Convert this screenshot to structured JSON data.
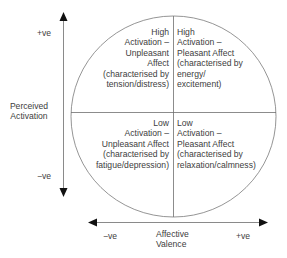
{
  "diagram": {
    "type": "circumplex-model-of-affect",
    "y_axis": {
      "label_line1": "Perceived",
      "label_line2": "Activation",
      "positive": "+ve",
      "negative": "−ve"
    },
    "x_axis": {
      "label_line1": "Affective",
      "label_line2": "Valence",
      "positive": "+ve",
      "negative": "−ve"
    },
    "quadrants": {
      "top_left": {
        "lines": [
          "High",
          "Activation –",
          "Unpleasant",
          "Affect",
          "(characterised by",
          "tension/distress)"
        ]
      },
      "top_right": {
        "lines": [
          "High",
          "Activation –",
          "Pleasant Affect",
          "(characterised by",
          "energy/",
          "excitement)"
        ]
      },
      "bottom_left": {
        "lines": [
          "Low",
          "Activation –",
          "Unpleasant Affect",
          "(characterised by",
          "fatigue/depression)"
        ]
      },
      "bottom_right": {
        "lines": [
          "Low",
          "Activation –",
          "Pleasant Affect",
          "(characterised by",
          "relaxation/calmness)"
        ]
      }
    },
    "colors": {
      "line": "#6e6e6e",
      "arrow": "#111111",
      "text": "#404040"
    }
  }
}
